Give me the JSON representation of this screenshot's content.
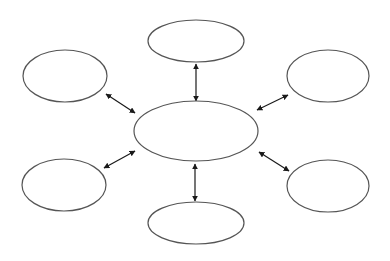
{
  "diagram": {
    "type": "hub-and-spoke",
    "background": "#ffffff",
    "node_stroke": "#555555",
    "edge_color": "#1a1a1a",
    "hub": {
      "id": "center",
      "label": "",
      "cx": 196,
      "cy": 131,
      "rx": 62,
      "ry": 30
    },
    "nodes": [
      {
        "id": "top",
        "label": "",
        "cx": 196,
        "cy": 41,
        "rx": 48,
        "ry": 21
      },
      {
        "id": "top-left",
        "label": "",
        "cx": 65,
        "cy": 76,
        "rx": 42,
        "ry": 26
      },
      {
        "id": "top-right",
        "label": "",
        "cx": 328,
        "cy": 76,
        "rx": 41,
        "ry": 26
      },
      {
        "id": "bottom-left",
        "label": "",
        "cx": 64,
        "cy": 185,
        "rx": 42,
        "ry": 26
      },
      {
        "id": "bottom-right",
        "label": "",
        "cx": 328,
        "cy": 186,
        "rx": 41,
        "ry": 26
      },
      {
        "id": "bottom",
        "label": "",
        "cx": 196,
        "cy": 223,
        "rx": 48,
        "ry": 21
      }
    ],
    "edges": [
      {
        "from": "center",
        "to": "top",
        "direction": "bidirectional",
        "x1": 196,
        "y1": 101,
        "x2": 196,
        "y2": 64
      },
      {
        "from": "center",
        "to": "top-left",
        "direction": "bidirectional",
        "x1": 135,
        "y1": 113,
        "x2": 106,
        "y2": 94
      },
      {
        "from": "center",
        "to": "top-right",
        "direction": "bidirectional",
        "x1": 257,
        "y1": 110,
        "x2": 288,
        "y2": 95
      },
      {
        "from": "center",
        "to": "bottom-left",
        "direction": "bidirectional",
        "x1": 135,
        "y1": 151,
        "x2": 104,
        "y2": 168
      },
      {
        "from": "center",
        "to": "bottom-right",
        "direction": "bidirectional",
        "x1": 259,
        "y1": 152,
        "x2": 289,
        "y2": 171
      },
      {
        "from": "center",
        "to": "bottom",
        "direction": "bidirectional",
        "x1": 195,
        "y1": 164,
        "x2": 195,
        "y2": 201
      }
    ]
  }
}
